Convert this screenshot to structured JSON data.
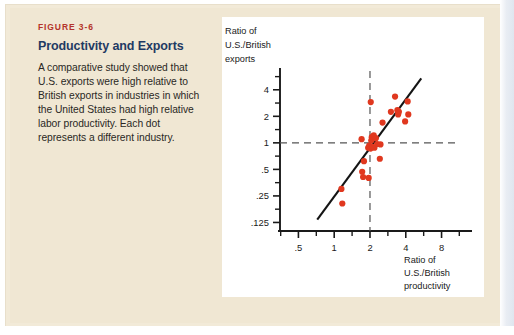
{
  "figure": {
    "number_label": "FIGURE 3-6",
    "title": "Productivity and Exports",
    "body": "A comparative study showed that U.S. exports were high relative to British exports in industries in which the United States had high relative labor productivity. Each dot represents a different industry.",
    "accent_number_color": "#b4342a",
    "accent_title_color": "#1f3a63",
    "panel_background": "#f0e7d3",
    "chart_background": "#ffffff"
  },
  "chart_data": {
    "type": "scatter",
    "title": "",
    "xlabel": "Ratio of U.S./British productivity",
    "ylabel": "Ratio of U.S./British exports",
    "xlabel_lines": [
      "Ratio of",
      "U.S./British",
      "productivity"
    ],
    "ylabel_lines": [
      "Ratio of",
      "U.S./British",
      "exports"
    ],
    "xscale": "log",
    "yscale": "log",
    "xlim": [
      0.35,
      11
    ],
    "ylim": [
      0.1,
      6.2
    ],
    "grid": false,
    "legend": null,
    "xticks": [
      0.5,
      1,
      2,
      4,
      8
    ],
    "xticklabels": [
      ".5",
      "1",
      "2",
      "4",
      "8"
    ],
    "yticks": [
      0.125,
      0.25,
      0.5,
      1,
      2,
      4
    ],
    "yticklabels": [
      ".125",
      ".25",
      ".5",
      "1",
      "2",
      "4"
    ],
    "point_color": "#e0381f",
    "point_radius_px": 3.1,
    "marker": "circle",
    "reference_lines": [
      {
        "name": "horizontal-unity",
        "orientation": "horizontal",
        "value": 1,
        "style": "dashed",
        "color": "#555555"
      },
      {
        "name": "vertical-unity",
        "orientation": "vertical",
        "value": 2,
        "style": "dashed",
        "color": "#555555"
      }
    ],
    "trend_line": {
      "name": "regression-line",
      "style": "solid",
      "color": "#141414",
      "x_start": 0.72,
      "y_start": 0.135,
      "x_end": 5.4,
      "y_end": 5.4
    },
    "points": [
      {
        "x": 1.15,
        "y": 0.3
      },
      {
        "x": 1.17,
        "y": 0.205
      },
      {
        "x": 1.72,
        "y": 0.47
      },
      {
        "x": 1.78,
        "y": 0.62
      },
      {
        "x": 1.75,
        "y": 0.41
      },
      {
        "x": 1.95,
        "y": 0.4
      },
      {
        "x": 1.7,
        "y": 1.1
      },
      {
        "x": 1.93,
        "y": 0.88
      },
      {
        "x": 1.97,
        "y": 0.93
      },
      {
        "x": 2.02,
        "y": 0.86
      },
      {
        "x": 2.05,
        "y": 1.06
      },
      {
        "x": 2.07,
        "y": 1.16
      },
      {
        "x": 2.15,
        "y": 1.22
      },
      {
        "x": 2.1,
        "y": 0.9
      },
      {
        "x": 2.18,
        "y": 0.88
      },
      {
        "x": 2.24,
        "y": 1.13
      },
      {
        "x": 2.3,
        "y": 0.97
      },
      {
        "x": 2.45,
        "y": 0.96
      },
      {
        "x": 2.42,
        "y": 0.66
      },
      {
        "x": 2.03,
        "y": 2.9
      },
      {
        "x": 2.55,
        "y": 1.7
      },
      {
        "x": 3.0,
        "y": 2.25
      },
      {
        "x": 3.25,
        "y": 3.35
      },
      {
        "x": 3.4,
        "y": 2.35
      },
      {
        "x": 3.45,
        "y": 2.1
      },
      {
        "x": 3.5,
        "y": 2.25
      },
      {
        "x": 3.95,
        "y": 1.75
      },
      {
        "x": 4.2,
        "y": 2.1
      },
      {
        "x": 4.15,
        "y": 2.95
      }
    ]
  }
}
